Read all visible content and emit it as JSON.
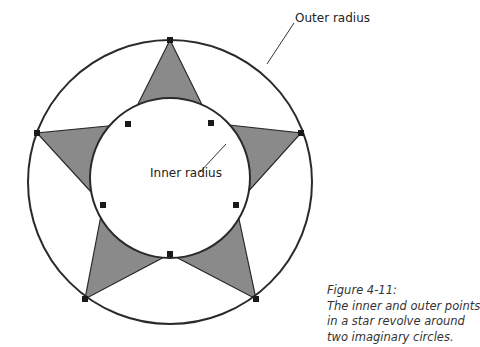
{
  "labels": {
    "outer": "Outer radius",
    "inner": "Inner radius"
  },
  "caption": {
    "title": "Figure 4-11:",
    "lines": [
      "The inner and outer points",
      "in a star revolve around",
      "two imaginary circles."
    ]
  },
  "colors": {
    "star_fill": "#8a8a8a",
    "stroke": "#2a2a2a",
    "background": "#ffffff"
  },
  "geometry": {
    "center": [
      170,
      180
    ],
    "outer_radius": 138,
    "inner_radius": 78,
    "points": 5
  }
}
